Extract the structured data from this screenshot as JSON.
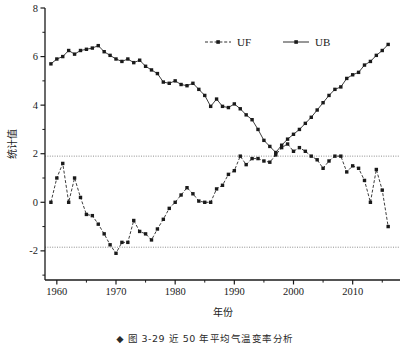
{
  "figure": {
    "caption": "◆ 图 3-29   近 50 年平均气温变率分析",
    "ylabel": "统计值",
    "xlabel": "年份"
  },
  "legend": {
    "position": "top-center",
    "items": [
      {
        "name": "UF",
        "label": "UF",
        "style": "dashed",
        "marker": "square",
        "color": "#1a1a1a"
      },
      {
        "name": "UB",
        "label": "UB",
        "style": "solid",
        "marker": "square",
        "color": "#1a1a1a"
      }
    ]
  },
  "chart_data": {
    "type": "line",
    "title": "",
    "subtitle": "",
    "xlabel": "年份",
    "ylabel": "统计值",
    "xlim": [
      1958.0,
      2018.0
    ],
    "ylim": [
      -3.2,
      8.0
    ],
    "grid": false,
    "legend_position": "top-center",
    "xticks": [
      1960,
      1970,
      1980,
      1990,
      2000,
      2010
    ],
    "xticklabels": [
      "1960",
      "1970",
      "1980",
      "1990",
      "2000",
      "2010"
    ],
    "yticks": [
      -2,
      0,
      2,
      4,
      6,
      8
    ],
    "yticklabels": [
      "-2",
      "0",
      "2",
      "4",
      "6",
      "8"
    ],
    "yminorticks": [
      -3,
      -1,
      1,
      3,
      5,
      7
    ],
    "annotations": [
      {
        "name": "upper-significance-line",
        "type": "hline",
        "y": 1.9,
        "style": "dotted",
        "color": "#808080"
      },
      {
        "name": "lower-significance-line",
        "type": "hline",
        "y": -1.85,
        "style": "dotted",
        "color": "#808080"
      }
    ],
    "x": [
      1959,
      1960,
      1961,
      1962,
      1963,
      1964,
      1965,
      1966,
      1967,
      1968,
      1969,
      1970,
      1971,
      1972,
      1973,
      1974,
      1975,
      1976,
      1977,
      1978,
      1979,
      1980,
      1981,
      1982,
      1983,
      1984,
      1985,
      1986,
      1987,
      1988,
      1989,
      1990,
      1991,
      1992,
      1993,
      1994,
      1995,
      1996,
      1997,
      1998,
      1999,
      2000,
      2001,
      2002,
      2003,
      2004,
      2005,
      2006,
      2007,
      2008,
      2009,
      2010,
      2011,
      2012,
      2013,
      2014,
      2015,
      2016
    ],
    "series": [
      {
        "name": "UF",
        "label": "UF",
        "style": "dashed",
        "marker": "square",
        "color": "#1a1a1a",
        "values": [
          0.0,
          1.0,
          1.6,
          0.0,
          1.0,
          0.2,
          -0.5,
          -0.55,
          -0.9,
          -1.3,
          -1.75,
          -2.1,
          -1.65,
          -1.65,
          -0.75,
          -1.2,
          -1.3,
          -1.55,
          -1.1,
          -0.7,
          -0.25,
          0.0,
          0.3,
          0.6,
          0.35,
          0.05,
          0.0,
          0.0,
          0.55,
          0.7,
          1.15,
          1.3,
          1.9,
          1.55,
          1.8,
          1.8,
          1.7,
          1.65,
          1.95,
          2.25,
          2.4,
          2.1,
          2.25,
          2.1,
          1.9,
          1.75,
          1.4,
          1.7,
          1.9,
          1.9,
          1.25,
          1.5,
          1.4,
          0.9,
          0.0,
          1.35,
          0.5,
          -1.0
        ]
      },
      {
        "name": "UB",
        "label": "UB",
        "style": "solid",
        "marker": "square",
        "color": "#1a1a1a",
        "values": [
          5.7,
          5.9,
          6.0,
          6.25,
          6.1,
          6.25,
          6.3,
          6.35,
          6.45,
          6.2,
          6.05,
          5.9,
          5.8,
          5.9,
          5.75,
          5.85,
          5.6,
          5.45,
          5.3,
          4.95,
          4.9,
          5.0,
          4.85,
          4.8,
          4.9,
          4.65,
          4.4,
          3.95,
          4.25,
          3.95,
          3.9,
          4.05,
          3.85,
          3.6,
          3.4,
          3.0,
          2.55,
          2.3,
          2.05,
          2.35,
          2.6,
          2.8,
          3.0,
          3.25,
          3.5,
          3.8,
          4.1,
          4.4,
          4.65,
          4.75,
          5.1,
          5.25,
          5.35,
          5.65,
          5.8,
          6.05,
          6.25,
          6.5
        ]
      }
    ]
  }
}
